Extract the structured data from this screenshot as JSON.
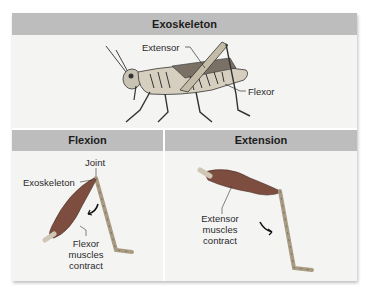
{
  "figure": {
    "main_header": "Exoskeleton",
    "grasshopper_labels": {
      "extensor": "Extensor",
      "flexor": "Flexor"
    },
    "panels": [
      {
        "header": "Flexion",
        "labels": {
          "joint": "Joint",
          "exoskeleton": "Exoskeleton",
          "caption_line1": "Flexor",
          "caption_line2": "muscles",
          "caption_line3": "contract"
        }
      },
      {
        "header": "Extension",
        "labels": {
          "caption_line1": "Extensor",
          "caption_line2": "muscles",
          "caption_line3": "contract"
        }
      }
    ],
    "colors": {
      "header_bg": "#bdbdbd",
      "panel_bg": "#f4f4f3",
      "muscle": "#8a5a4a",
      "leg": "#b8a890"
    }
  }
}
